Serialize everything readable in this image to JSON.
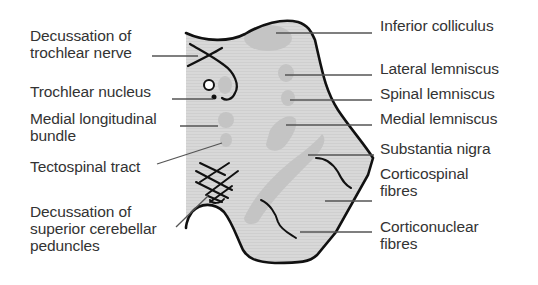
{
  "figure": {
    "colors": {
      "background": "#ffffff",
      "section_fill": "#d6d6d6",
      "shaded_region": "#c3c3c3",
      "outline": "#111111",
      "leader_line": "#555555",
      "text": "#333333"
    }
  },
  "labels": {
    "left": [
      {
        "id": "decussation-trochlear",
        "lines": [
          "Decussation of",
          "trochlear nerve"
        ]
      },
      {
        "id": "trochlear-nucleus",
        "lines": [
          "Trochlear nucleus"
        ]
      },
      {
        "id": "medial-longitudinal-bundle",
        "lines": [
          "Medial longitudinal",
          "bundle"
        ]
      },
      {
        "id": "tectospinal-tract",
        "lines": [
          "Tectospinal tract"
        ]
      },
      {
        "id": "decussation-superior-cerebellar",
        "lines": [
          "Decussation of",
          "superior cerebellar",
          "peduncles"
        ]
      }
    ],
    "right": [
      {
        "id": "inferior-colliculus",
        "lines": [
          "Inferior colliculus"
        ]
      },
      {
        "id": "lateral-lemniscus",
        "lines": [
          "Lateral lemniscus"
        ]
      },
      {
        "id": "spinal-lemniscus",
        "lines": [
          "Spinal lemniscus"
        ]
      },
      {
        "id": "medial-lemniscus",
        "lines": [
          "Medial lemniscus"
        ]
      },
      {
        "id": "substantia-nigra",
        "lines": [
          "Substantia nigra"
        ]
      },
      {
        "id": "corticospinal-fibres",
        "lines": [
          "Corticospinal",
          "fibres"
        ]
      },
      {
        "id": "corticonuclear-fibres",
        "lines": [
          "Corticonuclear",
          "fibres"
        ]
      }
    ]
  }
}
